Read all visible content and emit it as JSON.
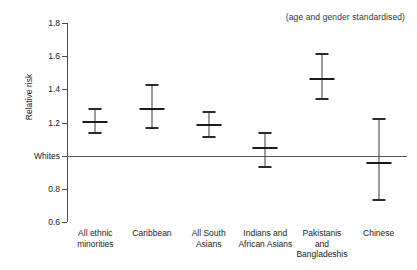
{
  "chart_data": {
    "type": "scatter",
    "title": "",
    "subtitle": "",
    "annotation": "(age and gender standardised)",
    "xlabel": "",
    "ylabel": "Relative risk",
    "ylim": [
      0.6,
      1.8
    ],
    "grid": false,
    "legend": null,
    "reference_line": {
      "label": "Whites",
      "value": 1.0
    },
    "yticks": [
      {
        "value": 1.8,
        "label": "1.8"
      },
      {
        "value": 1.6,
        "label": "1.6"
      },
      {
        "value": 1.4,
        "label": "1.4"
      },
      {
        "value": 1.2,
        "label": "1.2"
      },
      {
        "value": 1.0,
        "label": "Whites"
      },
      {
        "value": 0.8,
        "label": "0.8"
      },
      {
        "value": 0.6,
        "label": "0.6"
      }
    ],
    "categories": [
      "All ethnic minorities",
      "Caribbean",
      "All South Asians",
      "Indians and African Asians",
      "Pakistanis and Bangladeshis",
      "Chinese"
    ],
    "category_labels": [
      "All ethnic\nminorities",
      "Caribbean",
      "All South\nAsians",
      "Indians and\nAfrican Asians",
      "Pakistanis\nand\nBangladeshis",
      "Chinese"
    ],
    "values": [
      1.21,
      1.29,
      1.19,
      1.05,
      1.47,
      0.96
    ],
    "ci_lower": [
      1.14,
      1.17,
      1.12,
      0.94,
      1.35,
      0.74
    ],
    "ci_upper": [
      1.29,
      1.43,
      1.27,
      1.14,
      1.62,
      1.23
    ],
    "points": [
      {
        "category": "All ethnic minorities",
        "value": 1.21,
        "low": 1.14,
        "high": 1.29
      },
      {
        "category": "Caribbean",
        "value": 1.29,
        "low": 1.17,
        "high": 1.43
      },
      {
        "category": "All South Asians",
        "value": 1.19,
        "low": 1.12,
        "high": 1.27
      },
      {
        "category": "Indians and African Asians",
        "value": 1.05,
        "low": 0.94,
        "high": 1.14
      },
      {
        "category": "Pakistanis and Bangladeshis",
        "value": 1.47,
        "low": 1.35,
        "high": 1.62
      },
      {
        "category": "Chinese",
        "value": 0.96,
        "low": 0.74,
        "high": 1.23
      }
    ],
    "colors": {
      "axis": "#4a4a4a",
      "marker": "#1a1a1a",
      "whisker": "#3a3a3a",
      "reference": "#5a5a5a",
      "background": "#ffffff"
    }
  }
}
